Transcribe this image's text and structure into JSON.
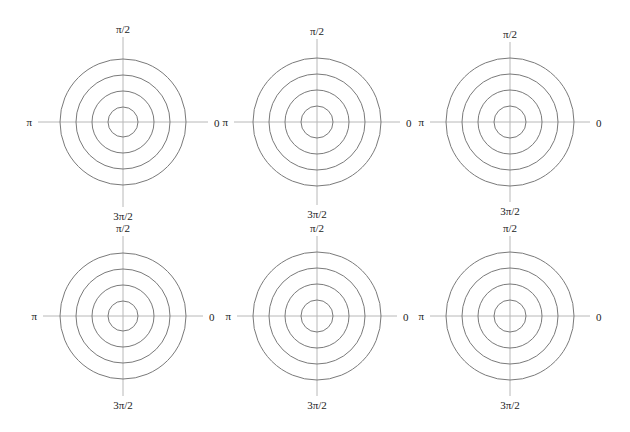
{
  "chart_data": {
    "type": "polar-grid",
    "title": "",
    "grid": true,
    "layout": {
      "rows": 2,
      "cols": 3
    },
    "style": {
      "ring_color": "#7a7a7a",
      "axis_color": "#b8b8b8",
      "background": "#ffffff"
    },
    "panels": [
      {
        "cx": 123,
        "cy": 122,
        "rings": [
          15,
          31,
          47,
          63
        ],
        "axis_len": 85,
        "labels": {
          "top": "π/2",
          "bottom": "3π/2",
          "left": "π",
          "right": "0"
        }
      },
      {
        "cx": 317,
        "cy": 122,
        "rings": [
          16,
          32,
          48,
          64
        ],
        "axis_len": 83,
        "labels": {
          "top": "π/2",
          "bottom": "3π/2",
          "left": "π",
          "right": "0"
        }
      },
      {
        "cx": 510,
        "cy": 122,
        "rings": [
          16,
          32,
          48,
          64
        ],
        "axis_len": 80,
        "labels": {
          "top": "π/2",
          "bottom": "3π/2",
          "left": "π",
          "right": "0"
        }
      },
      {
        "cx": 123,
        "cy": 316,
        "rings": [
          15,
          31,
          47,
          63
        ],
        "axis_len": 80,
        "labels": {
          "top": "π/2",
          "bottom": "3π/2",
          "left": "π",
          "right": "0"
        }
      },
      {
        "cx": 317,
        "cy": 316,
        "rings": [
          16,
          32,
          48,
          64
        ],
        "axis_len": 80,
        "labels": {
          "top": "π/2",
          "bottom": "3π/2",
          "left": "π",
          "right": "0"
        }
      },
      {
        "cx": 510,
        "cy": 316,
        "rings": [
          16,
          32,
          48,
          64
        ],
        "axis_len": 80,
        "labels": {
          "top": "π/2",
          "bottom": "3π/2",
          "left": "π",
          "right": "0"
        }
      }
    ],
    "angular_ticks": [
      "0",
      "π/2",
      "π",
      "3π/2"
    ],
    "radial_ring_count": 4,
    "series": []
  }
}
